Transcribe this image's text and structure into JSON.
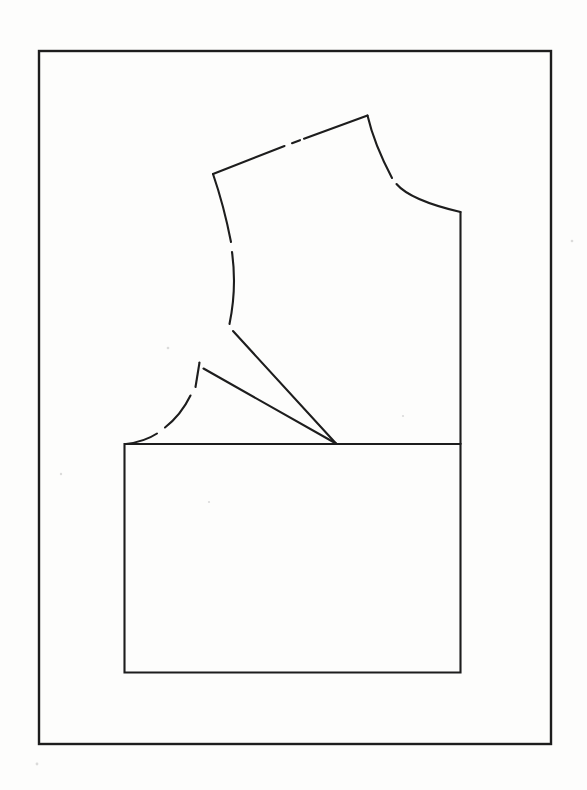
{
  "canvas": {
    "width": 587,
    "height": 790,
    "background": "#fdfdfc"
  },
  "diagram": {
    "name": "bodice-dart-rotation-diagram",
    "ink_color": "#1d1d1d",
    "stroke_width": 2.1,
    "border": {
      "x": 39,
      "y": 51,
      "width": 512,
      "height": 693,
      "stroke_width": 2.4
    },
    "paths": [
      {
        "name": "shoulder-seam-segment-1",
        "d": "M213,174 L284.5,146"
      },
      {
        "name": "shoulder-seam-dash",
        "d": "M292,143.2 L300,140.2"
      },
      {
        "name": "shoulder-seam-segment-2",
        "d": "M304,138.7 L367.5,115.5"
      },
      {
        "name": "neckline-segment-1",
        "d": "M367.5,115.5 C372,135 382,159 392,178"
      },
      {
        "name": "neckline-segment-2",
        "d": "M396.5,184 C405,194 422,203 460.5,212"
      },
      {
        "name": "center-front-seam",
        "d": "M460.5,212 L460.5,444"
      },
      {
        "name": "armhole-segment-1",
        "d": "M213,174 Q224,206 231,242"
      },
      {
        "name": "armhole-segment-2",
        "d": "M232,252 Q237,288 229.5,324"
      },
      {
        "name": "slash-line-upper",
        "d": "M233,331 L336,443.5"
      },
      {
        "name": "dart-leg-lower",
        "d": "M203.5,368.5 L336,443.5"
      },
      {
        "name": "side-seam-dash-1",
        "d": "M199.5,362.5 Q197.5,375 195.5,387"
      },
      {
        "name": "side-seam-dash-2",
        "d": "M190.5,395.5 Q181,415 165,427.5"
      },
      {
        "name": "side-seam-dash-3",
        "d": "M157,433.5 Q145,441.5 126,444"
      },
      {
        "name": "lower-section-outline",
        "d": "M124.5,444 L460.5,444 L460.5,672.5 L124.5,672.5 Z"
      }
    ],
    "specks": [
      {
        "x": 168,
        "y": 348,
        "r": 1.3
      },
      {
        "x": 61,
        "y": 474,
        "r": 1.2
      },
      {
        "x": 209,
        "y": 502,
        "r": 1.1
      },
      {
        "x": 572,
        "y": 241,
        "r": 1.3
      },
      {
        "x": 37,
        "y": 764,
        "r": 1.4
      },
      {
        "x": 403,
        "y": 416,
        "r": 1.1
      }
    ],
    "speck_color": "#9a9a9a"
  }
}
